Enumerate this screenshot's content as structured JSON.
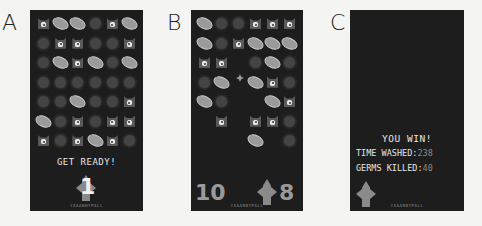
{
  "figure_labels": [
    "A",
    "B",
    "C"
  ],
  "panels": {
    "A": {
      "grid": [
        [
          "eye",
          "bean",
          "bean",
          "spiky",
          "eye",
          "bean"
        ],
        [
          "spiky",
          "eye",
          "eye",
          "spiky",
          "spiky",
          "eye"
        ],
        [
          "spiky",
          "bean",
          "eye",
          "bean",
          "spiky",
          "bean"
        ],
        [
          "spiky",
          "spiky",
          "spiky",
          "spiky",
          "spiky",
          "spiky"
        ],
        [
          "spiky",
          "spiky",
          "bean",
          "spiky",
          "spiky",
          "eye"
        ],
        [
          "bean",
          "spiky",
          "eye",
          "spiky",
          "eye",
          "eye"
        ],
        [
          "eye",
          "spiky",
          "eye",
          "bean",
          "eye",
          "spiky"
        ]
      ],
      "message": "GET READY!",
      "countdown": "1",
      "footer": "YAAANNYPALL"
    },
    "B": {
      "grid": [
        [
          "bean",
          "spiky",
          "spiky",
          "eye",
          "eye",
          "eye"
        ],
        [
          "bean",
          "spiky",
          "eye",
          "bean",
          "bean",
          "bean"
        ],
        [
          "eye",
          "eye",
          "empty",
          "spiky",
          "bean",
          "spiky"
        ],
        [
          "spiky",
          "bean",
          "empty",
          "bean",
          "eye",
          "spiky"
        ],
        [
          "bean",
          "spiky",
          "empty",
          "empty",
          "bean",
          "eye"
        ],
        [
          "empty",
          "eye",
          "empty",
          "eye",
          "eye",
          "spiky"
        ],
        [
          "empty",
          "empty",
          "empty",
          "bean",
          "empty",
          "spiky"
        ]
      ],
      "score_left": "10",
      "score_right": "8",
      "footer": "YAAANNYPALL"
    },
    "C": {
      "title": "YOU WIN!",
      "time_label": "TIME WASHED:",
      "time_value": "238",
      "germs_label": "GERMS KILLED:",
      "germs_value": "40",
      "footer": "YAAANNYPALL"
    }
  }
}
